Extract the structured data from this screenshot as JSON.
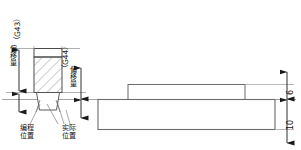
{
  "diagram": {
    "labels": {
      "g43": "（G43）",
      "g44": "（G44）",
      "offset_left": "偏移量",
      "offset_right": "偏移量",
      "programmed_position_line1": "编程",
      "programmed_position_line2": "位置",
      "actual_position_line1": "实际",
      "actual_position_line2": "位置"
    },
    "dimensions": [
      {
        "name": "step-height",
        "value": "6"
      },
      {
        "name": "base-height",
        "value": "10"
      }
    ],
    "colors": {
      "outline": "#4a4a4a",
      "thin_line": "#6b6b6b",
      "centerline": "#8c8c8c",
      "hatch": "#7a7a7a",
      "text": "#111111",
      "background": "#ffffff"
    }
  }
}
